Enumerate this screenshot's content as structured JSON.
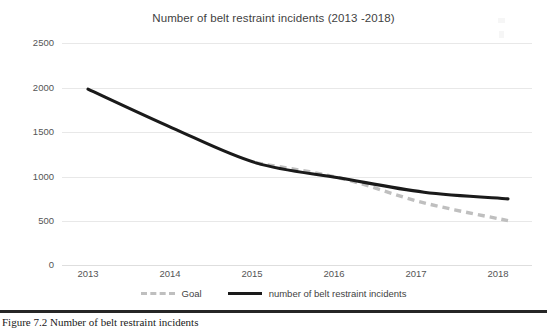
{
  "figure": {
    "caption": "Figure 7.2   Number of belt restraint incidents"
  },
  "chart_data": {
    "type": "line",
    "title": "Number of belt restraint incidents (2013 -2018)",
    "xlabel": "",
    "ylabel": "",
    "categories": [
      "2013",
      "2014",
      "2015",
      "2016",
      "2017",
      "2018"
    ],
    "x": [
      2013,
      2014,
      2015,
      2016,
      2017,
      2018
    ],
    "ylim": [
      0,
      2500
    ],
    "yticks": [
      0,
      500,
      1000,
      1500,
      2000,
      2500
    ],
    "ytick_labels": [
      "0",
      "500",
      "1000",
      "1500",
      "2000",
      "2500"
    ],
    "grid": true,
    "grid_axis": "y",
    "legend_position": "bottom",
    "series": [
      {
        "name": "Goal",
        "style": "dashed",
        "color": "#bfbfbf",
        "values": [
          null,
          null,
          1150,
          980,
          700,
          500
        ]
      },
      {
        "name": "number of belt restraint incidents",
        "style": "solid",
        "color": "#1a1a1a",
        "values": [
          1980,
          1545,
          1150,
          980,
          820,
          745
        ]
      }
    ]
  },
  "legend": {
    "items": [
      {
        "label": "Goal"
      },
      {
        "label": "number of belt restraint incidents"
      }
    ]
  },
  "colors": {
    "goal_line": "#bfbfbf",
    "incidents_line": "#1a1a1a",
    "gridline": "#e8e8e8",
    "text": "#555555",
    "rule": "#262626"
  }
}
